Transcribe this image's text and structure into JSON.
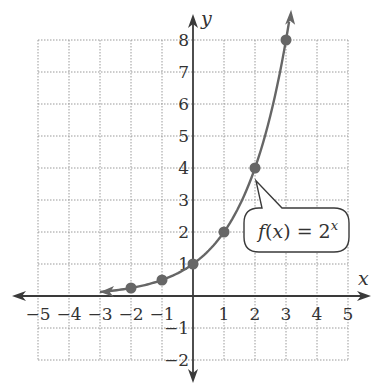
{
  "chart_data": {
    "type": "line",
    "title": "",
    "function_label": {
      "prefix": "f(",
      "var": "x",
      "mid": ") = 2",
      "exp": "x"
    },
    "xlabel": "x",
    "ylabel": "y",
    "xlim": [
      -5,
      5
    ],
    "ylim": [
      -2,
      8
    ],
    "grid": true,
    "x_ticks": [
      -5,
      -4,
      -3,
      -2,
      -1,
      1,
      2,
      3,
      4,
      5
    ],
    "x_tick_labels": [
      "−5",
      "−4",
      "−3",
      "−2",
      "−1",
      "1",
      "2",
      "3",
      "4",
      "5"
    ],
    "y_ticks": [
      -2,
      -1,
      1,
      2,
      3,
      4,
      5,
      6,
      7,
      8
    ],
    "y_tick_labels": [
      "−2",
      "−1",
      "1",
      "2",
      "3",
      "4",
      "5",
      "6",
      "7",
      "8"
    ],
    "series": [
      {
        "name": "f(x) = 2^x",
        "function": "2^x",
        "curve_domain": [
          -3,
          3.1
        ],
        "points": [
          {
            "x": -2,
            "y": 0.25
          },
          {
            "x": -1,
            "y": 0.5
          },
          {
            "x": 0,
            "y": 1
          },
          {
            "x": 1,
            "y": 2
          },
          {
            "x": 2,
            "y": 4
          },
          {
            "x": 3,
            "y": 8
          }
        ]
      }
    ],
    "annotation": {
      "text": "f(x) = 2^x",
      "points_to": {
        "x": 2,
        "y": 3.6
      }
    },
    "colors": {
      "axis": "#3a3a3a",
      "curve": "#666666",
      "points": "#666666",
      "grid": "#9a9a9a"
    }
  }
}
